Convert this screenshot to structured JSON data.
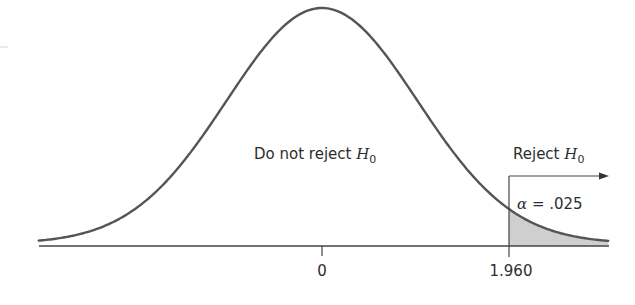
{
  "chart_data": {
    "type": "area",
    "title": "",
    "distribution": "standard normal",
    "mean": 0,
    "xlabel": "",
    "ylabel": "",
    "x_ticks": [
      {
        "value": 0,
        "label": "0"
      },
      {
        "value": 1.96,
        "label": "1.960"
      }
    ],
    "critical_value": 1.96,
    "alpha": 0.025,
    "shaded_region": {
      "from": 1.96,
      "to": "inf",
      "color": "#cfcfcf"
    },
    "x_range": [
      -2.97,
      3.0
    ],
    "grid": false,
    "annotations": [
      {
        "text": "Do not reject H0",
        "region": "x < 1.960"
      },
      {
        "text": "Reject H0",
        "region": "x > 1.960"
      },
      {
        "text": "α = .025",
        "region": "shaded tail"
      }
    ]
  },
  "labels": {
    "do_not_reject": "Do not reject ",
    "reject": "Reject ",
    "h": "H",
    "sub0": "0",
    "alpha_symbol": "α",
    "alpha_eq": " = .025",
    "tick_zero": "0",
    "tick_crit": "1.960"
  },
  "colors": {
    "curve": "#555555",
    "axis": "#444444",
    "shade": "#cfcfcf",
    "text": "#2e2e2e"
  }
}
